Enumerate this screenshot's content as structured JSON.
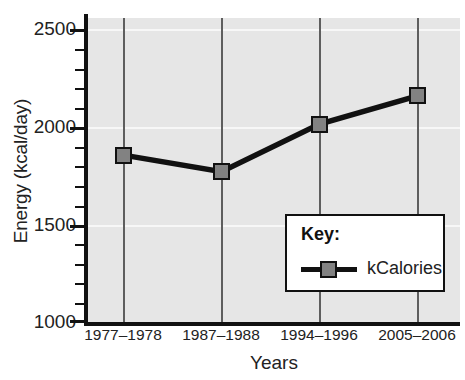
{
  "chart_data": {
    "type": "line",
    "title": "",
    "xlabel": "Years",
    "ylabel": "Energy (kcal/day)",
    "categories": [
      "1977–1978",
      "1987–1988",
      "1994–1996",
      "2005–2006"
    ],
    "series": [
      {
        "name": "kCalories",
        "values": [
          1850,
          1765,
          2010,
          2155
        ],
        "marker": "square",
        "marker_color": "#828282",
        "line_color": "#111111"
      }
    ],
    "ylim": [
      1000,
      2500
    ],
    "ytick_labels": [
      "2500",
      "2000",
      "1500",
      "1000"
    ],
    "ytick_values": [
      2500,
      2000,
      1500,
      1000
    ],
    "ytick_minor_step": 100,
    "grid": "horizontal",
    "plot_background": "#e6e6e6",
    "gridline_color": "#f7f7f7",
    "legend_position": "inside-lower-right"
  },
  "legend": {
    "title": "Key:",
    "entries": [
      {
        "label": "kCalories"
      }
    ]
  }
}
